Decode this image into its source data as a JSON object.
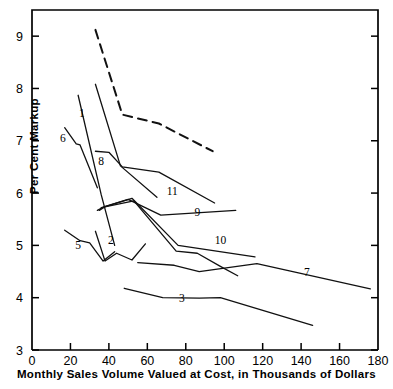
{
  "chart_data": {
    "type": "line",
    "title": "",
    "xlabel": "Monthly Sales Volume Valued at Cost, in Thousands of Dollars",
    "ylabel": "Per Cent Markup",
    "xlim": [
      0,
      180
    ],
    "ylim": [
      3,
      9.5
    ],
    "xticks": [
      0,
      20,
      40,
      60,
      80,
      100,
      120,
      140,
      160,
      180
    ],
    "xtick_labels": [
      "0",
      "20",
      "40",
      "60",
      "80",
      "100",
      "120",
      "140",
      "160",
      "180"
    ],
    "yticks": [
      3,
      4,
      5,
      6,
      7,
      8,
      9
    ],
    "ytick_labels": [
      "3",
      "4",
      "5",
      "6",
      "7",
      "8",
      "9"
    ],
    "grid": false,
    "legend": "inline-end-labels",
    "series": [
      {
        "name": "1",
        "label": "1",
        "style": "solid",
        "label_x": 26,
        "label_y": 7.45,
        "points": [
          [
            24,
            7.87
          ],
          [
            36,
            5.97
          ],
          [
            43,
            5.0
          ]
        ]
      },
      {
        "name": "2",
        "label": "2",
        "style": "solid",
        "label_x": 41,
        "label_y": 5.02,
        "points": [
          [
            33,
            5.27
          ],
          [
            38,
            4.7
          ],
          [
            44,
            4.85
          ],
          [
            52,
            4.72
          ],
          [
            59,
            5.03
          ]
        ]
      },
      {
        "name": "3",
        "label": "3",
        "style": "solid",
        "label_x": 78,
        "label_y": 3.92,
        "points": [
          [
            48,
            4.18
          ],
          [
            68,
            4.0
          ],
          [
            87,
            3.99
          ],
          [
            98,
            4.0
          ],
          [
            146,
            3.47
          ]
        ]
      },
      {
        "name": "5",
        "label": "5",
        "style": "solid",
        "label_x": 24,
        "label_y": 4.93,
        "points": [
          [
            17,
            5.29
          ],
          [
            25,
            5.09
          ],
          [
            30,
            5.05
          ],
          [
            37,
            4.7
          ],
          [
            43,
            4.88
          ]
        ]
      },
      {
        "name": "6",
        "label": "6",
        "style": "solid",
        "label_x": 16,
        "label_y": 6.98,
        "points": [
          [
            17,
            7.25
          ],
          [
            23,
            6.94
          ],
          [
            25,
            6.92
          ],
          [
            34,
            6.1
          ]
        ]
      },
      {
        "name": "7",
        "label": "7",
        "style": "solid",
        "label_x": 143,
        "label_y": 4.42,
        "points": [
          [
            55,
            4.67
          ],
          [
            74,
            4.62
          ],
          [
            87,
            4.5
          ],
          [
            117,
            4.65
          ],
          [
            176,
            4.17
          ]
        ]
      },
      {
        "name": "8",
        "label": "8",
        "style": "solid",
        "label_x": 36,
        "label_y": 6.54,
        "points": [
          [
            33,
            6.8
          ],
          [
            40,
            6.78
          ],
          [
            47,
            6.5
          ],
          [
            66,
            6.4
          ],
          [
            95,
            5.81
          ]
        ]
      },
      {
        "name": "9",
        "label": "9",
        "style": "solid",
        "label_x": 86,
        "label_y": 5.57,
        "points": [
          [
            34,
            5.67
          ],
          [
            37,
            5.73
          ],
          [
            50,
            5.88
          ],
          [
            67,
            5.58
          ],
          [
            106,
            5.67
          ]
        ]
      },
      {
        "name": "10",
        "label": "10",
        "style": "solid",
        "label_x": 98,
        "label_y": 5.02,
        "points": [
          [
            35,
            5.67
          ],
          [
            38,
            5.74
          ],
          [
            52,
            5.9
          ],
          [
            76,
            5.0
          ],
          [
            116,
            4.78
          ]
        ]
      },
      {
        "name": "11",
        "label": "11",
        "style": "solid",
        "label_x": 73,
        "label_y": 5.97,
        "points": [
          [
            33,
            8.08
          ],
          [
            46,
            6.52
          ],
          [
            65,
            5.92
          ]
        ]
      },
      {
        "name": "12",
        "label": "",
        "style": "solid",
        "label_x": null,
        "label_y": null,
        "points": [
          [
            36,
            5.72
          ],
          [
            53,
            5.85
          ],
          [
            75,
            4.89
          ],
          [
            86,
            4.85
          ],
          [
            98,
            4.6
          ],
          [
            107,
            4.42
          ]
        ]
      },
      {
        "name": "dashed",
        "label": "",
        "style": "dashed",
        "label_x": null,
        "label_y": null,
        "points": [
          [
            33,
            9.12
          ],
          [
            47,
            7.5
          ],
          [
            66,
            7.33
          ],
          [
            94,
            6.8
          ]
        ]
      }
    ]
  }
}
